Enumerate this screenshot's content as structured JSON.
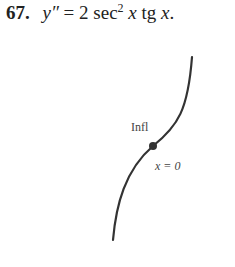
{
  "problem": {
    "number": "67.",
    "lhs": "y″",
    "eq": " = 2 sec",
    "sup": "2",
    "x1": " x",
    "tg": " tg ",
    "x2": "x",
    "period": "."
  },
  "figure": {
    "type": "sketch",
    "curve_description": "increasing curve, concave down on left, concave up on right",
    "inflection_label": "Infl",
    "point_label": "x = 0",
    "curve_color": "#333333",
    "point_color": "#333333"
  }
}
